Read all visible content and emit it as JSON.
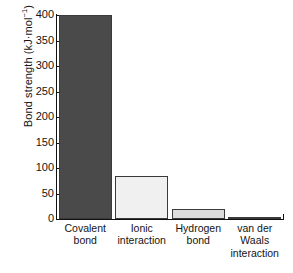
{
  "chart_data": {
    "type": "bar",
    "title": "",
    "xlabel": "",
    "ylabel": "Bond strength (kJ·mol⁻¹)",
    "ylabel_main": "Bond strength (kJ·mol",
    "ylabel_exponent": "−1",
    "ylabel_tail": ")",
    "categories": [
      "Covalent bond",
      "Ionic interaction",
      "Hydrogen bond",
      "van der Waals interaction"
    ],
    "category_lines": [
      [
        "Covalent",
        "bond"
      ],
      [
        "Ionic",
        "interaction"
      ],
      [
        "Hydrogen",
        "bond"
      ],
      [
        "van der",
        "Waals",
        "interaction"
      ]
    ],
    "values": [
      400,
      85,
      20,
      3
    ],
    "ylim": [
      0,
      400
    ],
    "ytick_values": [
      400,
      350,
      300,
      250,
      200,
      150,
      100,
      50,
      0
    ],
    "ytick_labels": [
      "400",
      "350",
      "300",
      "250",
      "200",
      "150",
      "100",
      "50",
      "0"
    ],
    "bar_colors": [
      "#4a4a4a",
      "#f0f0f0",
      "#dcdcdc",
      "#2b2b2b"
    ],
    "bar_edge_color": "#3a3a3a",
    "grid": false,
    "legend": false,
    "axis_color": "#101010"
  }
}
